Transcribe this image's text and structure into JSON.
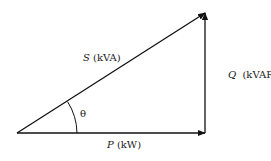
{
  "diagram": {
    "colors": {
      "stroke": "#111111",
      "text": "#1a1a1a",
      "background": "#ffffff"
    },
    "vertices": {
      "origin": [
        17,
        133
      ],
      "right_angle": [
        205,
        133
      ],
      "apex": [
        205,
        13
      ]
    },
    "edges": [
      {
        "id": "P",
        "from": "origin",
        "to": "right_angle",
        "arrow": true
      },
      {
        "id": "Q",
        "from": "right_angle",
        "to": "apex",
        "arrow": true
      },
      {
        "id": "S",
        "from": "origin",
        "to": "apex",
        "arrow": true
      }
    ],
    "labels": {
      "S": {
        "symbol": "S",
        "unit": " (kVA)"
      },
      "Q": {
        "symbol": "Q",
        "unit": "  (kVAR)"
      },
      "P": {
        "symbol": "P",
        "unit": " (kW)"
      },
      "angle": "θ"
    }
  }
}
